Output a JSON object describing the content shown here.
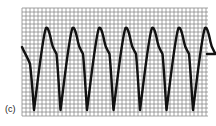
{
  "figure": {
    "panel_label": "(c)",
    "grid": {
      "x0": 22,
      "y0": 8,
      "x1": 208,
      "y1": 116,
      "minor_spacing": 4,
      "line_color": "#8a8a8a",
      "background": "#ffffff"
    },
    "trace": {
      "color": "#111111",
      "cycles": 7,
      "period_px": 26.5
    }
  },
  "chart_data": {
    "type": "line",
    "title": "",
    "xlabel": "",
    "ylabel": "",
    "legend": [],
    "annotations": [
      "(c)"
    ],
    "grid": true,
    "x": [
      0,
      0.45,
      1.0,
      1.45,
      2.0,
      2.45,
      3.0,
      3.45,
      4.0,
      4.45,
      5.0,
      5.45,
      6.0,
      6.45,
      7.0
    ],
    "values": [
      0.65,
      -1.0,
      1.0,
      -1.0,
      1.0,
      -1.0,
      1.0,
      -1.0,
      1.0,
      -1.0,
      1.0,
      -1.0,
      1.0,
      -1.0,
      1.0
    ]
  }
}
